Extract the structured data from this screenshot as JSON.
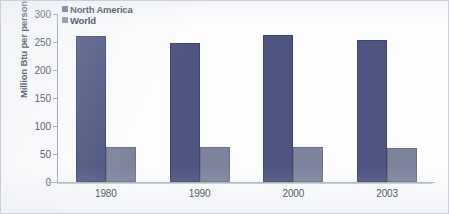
{
  "chart_data": {
    "type": "bar",
    "title": "",
    "xlabel": "",
    "ylabel": "Million Btu per person",
    "categories": [
      "1980",
      "1990",
      "2000",
      "2003"
    ],
    "series": [
      {
        "name": "North America",
        "color": "#4d5580",
        "values": [
          261,
          248,
          262,
          254
        ]
      },
      {
        "name": "World",
        "color": "#7e849b",
        "values": [
          62,
          63,
          62,
          61
        ]
      }
    ],
    "ylim": [
      0,
      300
    ],
    "yticks": [
      0,
      50,
      100,
      150,
      200,
      250,
      300
    ],
    "ytick_labels": [
      "0",
      "50",
      "100",
      "150",
      "200",
      "250",
      "300"
    ],
    "grid": false,
    "legend_position": "top-left",
    "legend": [
      {
        "label": "North America",
        "swatch": "legend-swatch-north-america"
      },
      {
        "label": "World",
        "swatch": "legend-swatch-world"
      }
    ]
  },
  "colors": {
    "north_america": "#4d5580",
    "world": "#7e849b",
    "axis": "#9aa2b4",
    "text": "#323b4a",
    "background": "#fdfdfd"
  }
}
